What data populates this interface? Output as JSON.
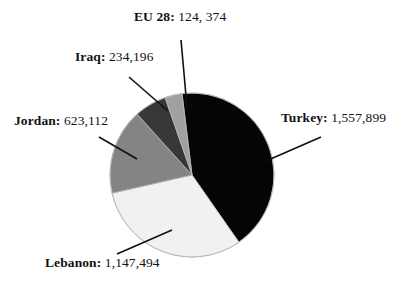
{
  "chart_data": {
    "type": "pie",
    "title": "",
    "xlabel": "",
    "ylabel": "",
    "legend_position": "none",
    "grid": false,
    "label_format": "{name}: {value}",
    "total": 3687075,
    "categories": [
      "Turkey",
      "Lebanon",
      "Jordan",
      "Iraq",
      "EU 28"
    ],
    "values": [
      1557899,
      1147494,
      623112,
      234196,
      124374
    ],
    "value_labels": [
      "1,557,899",
      "1,147,494",
      "623,112",
      "234,196",
      "124, 374"
    ],
    "percents": [
      42.3,
      31.1,
      16.9,
      6.4,
      3.4
    ],
    "colors": [
      "#050505",
      "#f1f1f1",
      "#848484",
      "#373737",
      "#a0a0a0"
    ],
    "start_angle_deg": -7,
    "direction": "clockwise",
    "slices": [
      {
        "name": "Turkey",
        "value_label": "1,557,899",
        "value": 1557899,
        "color": "#050505",
        "percent": 42.3
      },
      {
        "name": "Lebanon",
        "value_label": "1,147,494",
        "value": 1147494,
        "color": "#f1f1f1",
        "percent": 31.1
      },
      {
        "name": "Jordan",
        "value_label": "623,112",
        "value": 623112,
        "color": "#848484",
        "percent": 16.9
      },
      {
        "name": "Iraq",
        "value_label": "234,196",
        "value": 234196,
        "color": "#373737",
        "percent": 6.4
      },
      {
        "name": "EU 28",
        "value_label": "124, 374",
        "value": 124374,
        "color": "#a0a0a0",
        "percent": 3.4
      }
    ]
  },
  "labels": {
    "turkey": {
      "name": "Turkey:",
      "value": " 1,557,899"
    },
    "lebanon": {
      "name": "Lebanon:",
      "value": " 1,147,494"
    },
    "jordan": {
      "name": "Jordan:",
      "value": " 623,112"
    },
    "iraq": {
      "name": "Iraq:",
      "value": " 234,196"
    },
    "eu28": {
      "name": "EU 28:",
      "value": " 124, 374"
    }
  },
  "style": {
    "background": "#ffffff",
    "outline": "#b9b9b9",
    "leader_line": "#101010"
  }
}
